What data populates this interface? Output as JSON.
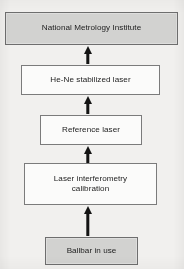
{
  "diagram": {
    "orientation": "bottom-to-top",
    "background_color": "#f1f0ee",
    "line_color": "#141414",
    "fill_gray": "#d2d2d0",
    "fill_white": "#fbfbfa",
    "nodes": [
      {
        "id": "nmi",
        "label": "National Metrology Institute",
        "style": "filled",
        "level": 5
      },
      {
        "id": "hene",
        "label": "He-Ne stabilized laser",
        "style": "plain",
        "level": 4
      },
      {
        "id": "reference",
        "label": "Reference laser",
        "style": "plain",
        "level": 3
      },
      {
        "id": "interferometry",
        "label": "Laser interferometry\ncalibration",
        "style": "plain",
        "level": 2
      },
      {
        "id": "ballbar",
        "label": "Ballbar in use",
        "style": "filled",
        "level": 1
      }
    ],
    "arrows": [
      {
        "id": "arrow-interferometry-to-reference",
        "from": "interferometry",
        "to": "reference",
        "direction": "up"
      },
      {
        "id": "arrow-reference-to-hene",
        "from": "reference",
        "to": "hene",
        "direction": "up"
      },
      {
        "id": "arrow-hene-to-nmi",
        "from": "hene",
        "to": "nmi",
        "direction": "up"
      },
      {
        "id": "arrow-ballbar-to-interferometry",
        "from": "ballbar",
        "to": "interferometry",
        "direction": "up"
      }
    ]
  }
}
